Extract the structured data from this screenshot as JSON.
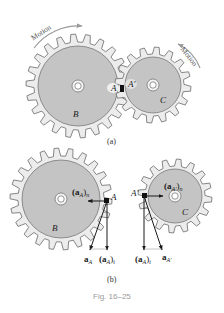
{
  "figure": {
    "caption": "Fig. 16–25",
    "panels": [
      {
        "id": "a",
        "label": "(a)",
        "motion_labels": [
          "Motion",
          "Motion"
        ],
        "gears": [
          {
            "name": "B",
            "label": "B"
          },
          {
            "name": "C",
            "label": "C"
          }
        ],
        "points": [
          {
            "name": "A",
            "label": "A"
          },
          {
            "name": "A'",
            "label": "A'"
          }
        ]
      },
      {
        "id": "b",
        "label": "(b)",
        "gears": [
          {
            "name": "B",
            "label": "B"
          },
          {
            "name": "C",
            "label": "C"
          }
        ],
        "points": [
          {
            "name": "A",
            "label": "A"
          },
          {
            "name": "A'",
            "label": "A'"
          }
        ],
        "vectors_left": {
          "normal": {
            "main": "(a",
            "sub": "A",
            "close": ")",
            "tail": "n"
          },
          "tangential": {
            "main": "(a",
            "sub": "A",
            "close": ")",
            "tail": "t"
          },
          "total": {
            "main": "a",
            "sub": "A"
          }
        },
        "vectors_right": {
          "normal": {
            "main": "(a",
            "sub": "A'",
            "close": ")",
            "tail": "n"
          },
          "tangential": {
            "main": "(a",
            "sub": "A",
            "close": ")",
            "tail": "t"
          },
          "total": {
            "main": "a",
            "sub": "A'"
          }
        }
      }
    ]
  },
  "colors": {
    "gear_rim": "#ececec",
    "gear_disk": "#c4c4c4",
    "outline": "#6a6a6a",
    "arrow": "#1a1a1a",
    "motion_arrow": "#9a9a9a",
    "caption": "#9a9a9a"
  }
}
